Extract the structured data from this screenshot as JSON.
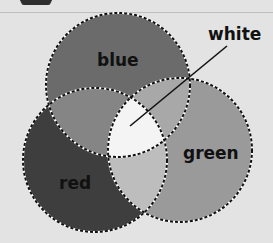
{
  "diagram": {
    "type": "venn",
    "sets": [
      {
        "id": "blue",
        "label": "blue",
        "fill": "#6b6b6b",
        "cx": 118,
        "cy": 85,
        "r": 72
      },
      {
        "id": "red",
        "label": "red",
        "fill": "#3e3e3e",
        "cx": 95,
        "cy": 160,
        "r": 72
      },
      {
        "id": "green",
        "label": "green",
        "fill": "#9a9a9a",
        "cx": 180,
        "cy": 150,
        "r": 72
      }
    ],
    "intersections": {
      "blue_red": "#858585",
      "blue_green": "#a8a8a8",
      "red_green": "#bdbdbd",
      "all": "#f4f4f4"
    },
    "annotation": {
      "label": "white",
      "line_from": [
        227,
        46
      ],
      "line_to": [
        130,
        126
      ]
    }
  }
}
